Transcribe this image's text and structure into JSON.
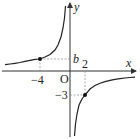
{
  "diagram": {
    "type": "function-graph",
    "function": "y = k/x (hyperbola)",
    "axes": {
      "x_label": "x",
      "y_label": "y",
      "origin_label": "O"
    },
    "points": [
      {
        "x": -4,
        "y_label": "b",
        "x_tick_label": "−4"
      },
      {
        "x": 2,
        "y": -3,
        "x_tick_label": "2",
        "y_tick_label": "−3"
      }
    ],
    "labels": {
      "minus4": "−4",
      "two": "2",
      "b": "b",
      "minus3": "−3",
      "origin": "O",
      "x": "x",
      "y": "y"
    },
    "colors": {
      "curve": "#222222",
      "axis": "#333333",
      "guide": "#888888"
    }
  }
}
